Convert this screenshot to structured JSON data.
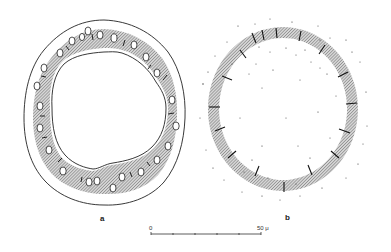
{
  "figure": {
    "panels": [
      {
        "id": "a",
        "label": "a",
        "description": "Cross-section ring with outer contour, hatched band containing oval cells and short radial strokes, and irregular inner contour",
        "oval_count": 30
      },
      {
        "id": "b",
        "label": "b",
        "description": "Circular hatched ring divided by radial tick marks, with scattered dots inside and outside",
        "tick_count": 20
      }
    ],
    "scale_bar": {
      "start_label": "0",
      "end_label": "50 μ",
      "ticks": 6
    },
    "colors": {
      "line": "#222222",
      "hatch": "#8a8a8a",
      "dots": "#333333",
      "background": "#ffffff"
    }
  }
}
